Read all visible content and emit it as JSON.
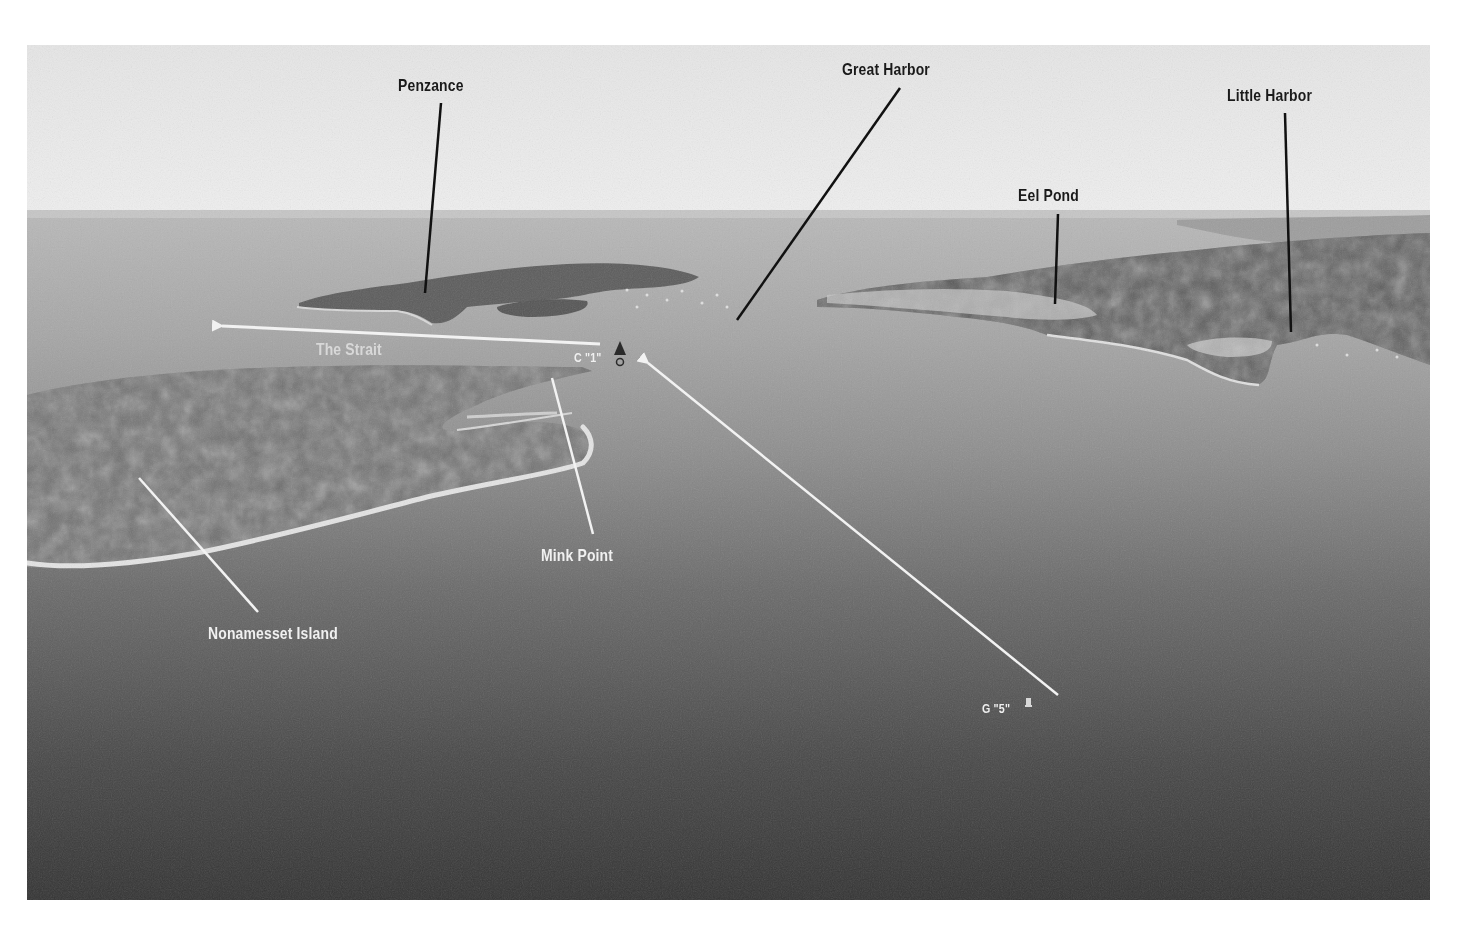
{
  "image": {
    "description": "Grayscale aerial photograph of a harbor channel with annotated landmarks",
    "colors": {
      "sky": "#e8e8e8",
      "horizon_water": "#b8b8b8",
      "mid_water": "#8a8a8a",
      "foreground_water": "#3a3a3a",
      "land": "#6a6a6a",
      "label_dark": "#1a1a1a",
      "label_light": "#f0f0f0",
      "leader_dark": "#111111",
      "leader_light": "#f2f2f2"
    }
  },
  "labels": {
    "penzance": "Penzance",
    "great_harbor": "Great Harbor",
    "little_harbor": "Little Harbor",
    "eel_pond": "Eel Pond",
    "the_strait": "The Strait",
    "c1": "C \"1\"",
    "mink_point": "Mink Point",
    "nonamesset_island": "Nonamesset Island",
    "g5": "G \"5\""
  },
  "markers": {
    "c1_buoy": "nun-buoy-icon",
    "g5_buoy": "can-buoy-icon"
  }
}
